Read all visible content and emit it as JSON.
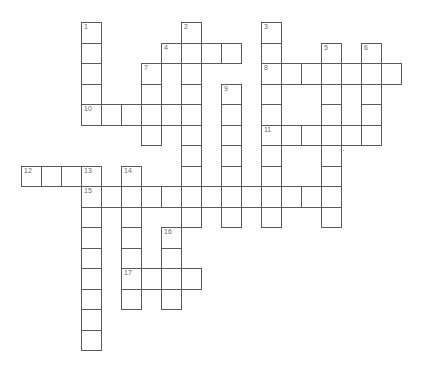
{
  "puzzle": {
    "type": "crossword",
    "grid_origin": {
      "x": 81,
      "y": 22
    },
    "cell_width": 20,
    "cell_height": 20.5,
    "border_color": "#5a5a5a",
    "number_color": "#6a6a6a",
    "entries": [
      {
        "number": "1",
        "direction": "down",
        "row": 0,
        "col": 0,
        "length": 5
      },
      {
        "number": "2",
        "direction": "down",
        "row": 0,
        "col": 5,
        "length": 10
      },
      {
        "number": "3",
        "direction": "down",
        "row": 0,
        "col": 9,
        "length": 10
      },
      {
        "number": "4",
        "direction": "across",
        "row": 1,
        "col": 4,
        "length": 4
      },
      {
        "number": "5",
        "direction": "down",
        "row": 1,
        "col": 12,
        "length": 9
      },
      {
        "number": "6",
        "direction": "down",
        "row": 1,
        "col": 14,
        "length": 5
      },
      {
        "number": "7",
        "direction": "down",
        "row": 2,
        "col": 3,
        "length": 4
      },
      {
        "number": "8",
        "direction": "across",
        "row": 2,
        "col": 9,
        "length": 7
      },
      {
        "number": "9",
        "direction": "down",
        "row": 3,
        "col": 7,
        "length": 7
      },
      {
        "number": "10",
        "direction": "across",
        "row": 4,
        "col": 0,
        "length": 6
      },
      {
        "number": "11",
        "direction": "across",
        "row": 5,
        "col": 9,
        "length": 6
      },
      {
        "number": "12",
        "direction": "across",
        "row": 7,
        "col": -3,
        "length": 4
      },
      {
        "number": "13",
        "direction": "down",
        "row": 7,
        "col": 0,
        "length": 9
      },
      {
        "number": "14",
        "direction": "down",
        "row": 7,
        "col": 2,
        "length": 7
      },
      {
        "number": "15",
        "direction": "across",
        "row": 8,
        "col": 0,
        "length": 13
      },
      {
        "number": "16",
        "direction": "down",
        "row": 10,
        "col": 4,
        "length": 4
      },
      {
        "number": "17",
        "direction": "across",
        "row": 12,
        "col": 2,
        "length": 4
      }
    ]
  }
}
